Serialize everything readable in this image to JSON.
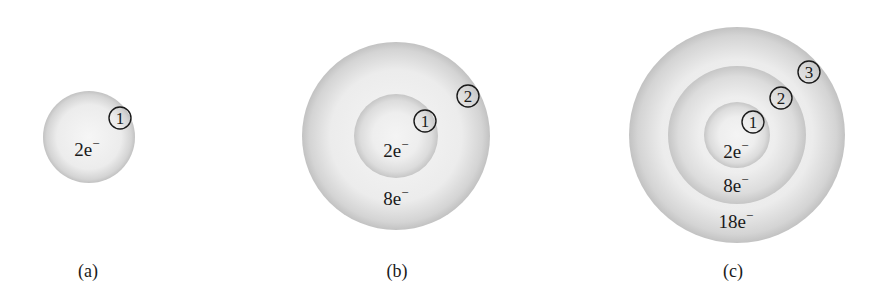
{
  "figure": {
    "panels": [
      {
        "id": "a",
        "caption": "(a)",
        "center": [
          89,
          137
        ],
        "shell_radii": [
          46
        ],
        "shells": [
          {
            "number": "1",
            "marker": [
              120,
              118
            ],
            "electrons": "2e",
            "charge": "−",
            "label_pos": [
              87,
              156
            ]
          }
        ]
      },
      {
        "id": "b",
        "caption": "(b)",
        "center": [
          396,
          136
        ],
        "shell_radii": [
          42,
          94
        ],
        "shells": [
          {
            "number": "1",
            "marker": [
              425,
              121
            ],
            "electrons": "2e",
            "charge": "−",
            "label_pos": [
              396,
              157
            ]
          },
          {
            "number": "2",
            "marker": [
              468,
              96
            ],
            "electrons": "8e",
            "charge": "−",
            "label_pos": [
              396,
              205
            ]
          }
        ]
      },
      {
        "id": "c",
        "caption": "(c)",
        "center": [
          737,
          135
        ],
        "shell_radii": [
          33,
          69,
          108
        ],
        "shells": [
          {
            "number": "1",
            "marker": [
              753,
              122
            ],
            "electrons": "2e",
            "charge": "−",
            "label_pos": [
              736,
              158
            ]
          },
          {
            "number": "2",
            "marker": [
              781,
              98
            ],
            "electrons": "8e",
            "charge": "−",
            "label_pos": [
              736,
              192
            ]
          },
          {
            "number": "3",
            "marker": [
              809,
              72
            ],
            "electrons": "18e",
            "charge": "−",
            "label_pos": [
              736,
              228
            ]
          }
        ]
      }
    ],
    "caption_y": 277,
    "caption_x": [
      88,
      397,
      733
    ],
    "colors": {
      "shell_center": "#f7f7f7",
      "shell_edge": "#bdbdbd",
      "text": "#1a1a1a"
    }
  }
}
